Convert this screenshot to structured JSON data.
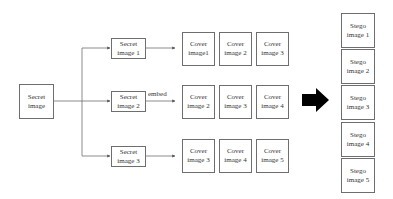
{
  "diagram": {
    "source": {
      "label": "Secret\nimage"
    },
    "secrets": [
      {
        "label": "Secret\nimage 1"
      },
      {
        "label": "Secret\nimage 2"
      },
      {
        "label": "Secret\nimage 3"
      }
    ],
    "edge_label": "embed",
    "covers": [
      [
        {
          "label": "Cover\nimage1"
        },
        {
          "label": "Cover\nimage 2"
        },
        {
          "label": "Cover\nimage 3"
        }
      ],
      [
        {
          "label": "Cover\nimage 2"
        },
        {
          "label": "Cover\nimage 3"
        },
        {
          "label": "Cover\nimage 4"
        }
      ],
      [
        {
          "label": "Cover\nimage 3"
        },
        {
          "label": "Cover\nimage 4"
        },
        {
          "label": "Cover\nimage 5"
        }
      ]
    ],
    "stegos": [
      {
        "label": "Stego\nimage 1"
      },
      {
        "label": "Stego\nimage 2"
      },
      {
        "label": "Stego\nimage 3"
      },
      {
        "label": "Stego\nimage 4"
      },
      {
        "label": "Stego\nimage 5"
      }
    ],
    "arrow_color": "#000000",
    "line_color": "#6e6e6e"
  }
}
